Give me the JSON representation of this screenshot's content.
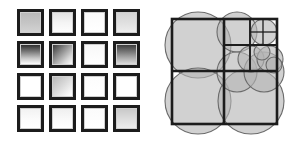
{
  "figure": {
    "background_color": "#ffffff",
    "width": 304,
    "height": 151,
    "panels": [
      "square-grid",
      "recursive-circles"
    ]
  },
  "grid": {
    "name": "gradient-square-grid",
    "rows": 4,
    "columns": 4,
    "cell_size": 27,
    "gap": 5,
    "origin_x": 17,
    "origin_y": 9,
    "border_color": "#1c1c1c",
    "border_width": 3,
    "cells": [
      {
        "row": 1,
        "col": 1,
        "label": "r1c1",
        "fill": "linear-gradient(180deg, #b9b9b9 0%, #c6c6c6 55%, #d2d2d2 100%)"
      },
      {
        "row": 1,
        "col": 2,
        "label": "r1c2",
        "fill": "linear-gradient(180deg, #e3e3e3 0%, #f4f4f4 50%, #fdfdfd 100%)"
      },
      {
        "row": 1,
        "col": 3,
        "label": "r1c3",
        "fill": "linear-gradient(180deg, #fafafa 0%, #ffffff 100%)"
      },
      {
        "row": 1,
        "col": 4,
        "label": "r1c4",
        "fill": "linear-gradient(180deg, #d4d4d4 0%, #e2e2e2 60%, #ededed 100%)"
      },
      {
        "row": 2,
        "col": 1,
        "label": "r2c1",
        "fill": "linear-gradient(180deg, #2e2e2e 0%, #7a7a7a 35%, #c8c8c8 70%, #fcfcfc 100%)"
      },
      {
        "row": 2,
        "col": 2,
        "label": "r2c2",
        "fill": "linear-gradient(135deg, #3a3a3a 0%, #8e8e8e 40%, #d5d5d5 75%, #fbfbfb 100%)"
      },
      {
        "row": 2,
        "col": 3,
        "label": "r2c3",
        "fill": "linear-gradient(180deg, #f7f7f7 0%, #ffffff 100%)"
      },
      {
        "row": 2,
        "col": 4,
        "label": "r2c4",
        "fill": "linear-gradient(180deg, #3c3c3c 0%, #6e6e6e 30%, #a8a8a8 65%, #dcdcdc 100%)"
      },
      {
        "row": 3,
        "col": 1,
        "label": "r3c1",
        "fill": "linear-gradient(180deg, #ffffff 0%, #ffffff 100%)"
      },
      {
        "row": 3,
        "col": 2,
        "label": "r3c2",
        "fill": "linear-gradient(135deg, #b8b8b8 0%, #d8d8d8 45%, #f6f6f6 85%, #ffffff 100%)"
      },
      {
        "row": 3,
        "col": 3,
        "label": "r3c3",
        "fill": "linear-gradient(180deg, #fcfcfc 0%, #ffffff 100%)"
      },
      {
        "row": 3,
        "col": 4,
        "label": "r3c4",
        "fill": "linear-gradient(180deg, #ffffff 0%, #ffffff 100%)"
      },
      {
        "row": 4,
        "col": 1,
        "label": "r4c1",
        "fill": "linear-gradient(180deg, #f2f2f2 0%, #fcfcfc 60%, #ffffff 100%)"
      },
      {
        "row": 4,
        "col": 2,
        "label": "r4c2",
        "fill": "linear-gradient(180deg, #efefef 0%, #fafafa 60%, #ffffff 100%)"
      },
      {
        "row": 4,
        "col": 3,
        "label": "r4c3",
        "fill": "linear-gradient(180deg, #fbfbfb 0%, #ffffff 100%)"
      },
      {
        "row": 4,
        "col": 4,
        "label": "r4c4",
        "fill": "linear-gradient(180deg, #c9c9c9 0%, #dcdcdc 50%, #ececec 100%)"
      }
    ]
  },
  "circles": {
    "name": "recursive-circle-square-packing",
    "disc_fill": "#b4b4b4",
    "disc_opacity": 0.62,
    "disc_stroke": "#6b6b6b",
    "box_stroke": "#1c1c1c",
    "outer_square": {
      "x": 22,
      "y": 19,
      "size": 105
    },
    "discs": [
      {
        "id": "d-outer-tl",
        "cx": 48,
        "cy": 45,
        "r": 33
      },
      {
        "id": "d-outer-bl",
        "cx": 48,
        "cy": 101,
        "r": 33
      },
      {
        "id": "d-outer-br",
        "cx": 101,
        "cy": 101,
        "r": 33
      },
      {
        "id": "d-q2-tl",
        "cx": 87,
        "cy": 32,
        "r": 20
      },
      {
        "id": "d-q2-bl",
        "cx": 87,
        "cy": 72,
        "r": 20
      },
      {
        "id": "d-q2-br",
        "cx": 114,
        "cy": 72,
        "r": 20
      },
      {
        "id": "d-q3-tl",
        "cx": 114,
        "cy": 32,
        "r": 13
      },
      {
        "id": "d-q3-bl",
        "cx": 101,
        "cy": 59,
        "r": 13
      },
      {
        "id": "d-q3-br",
        "cx": 120,
        "cy": 59,
        "r": 13
      },
      {
        "id": "d-q4-tl",
        "cx": 112,
        "cy": 52,
        "r": 8
      },
      {
        "id": "d-q4-br",
        "cx": 124,
        "cy": 65,
        "r": 8
      }
    ],
    "squares": [
      {
        "id": "s-main",
        "x": 22,
        "y": 19,
        "w": 105,
        "h": 105,
        "weight": "box"
      },
      {
        "id": "s-div-h",
        "x": 22,
        "y": 71,
        "w": 105,
        "h": 0,
        "weight": "box"
      },
      {
        "id": "s-div-v",
        "x": 74,
        "y": 19,
        "w": 0,
        "h": 105,
        "weight": "box"
      },
      {
        "id": "s-q2-h",
        "x": 74,
        "y": 45,
        "w": 53,
        "h": 0,
        "weight": "box-thin"
      },
      {
        "id": "s-q2-v",
        "x": 100,
        "y": 19,
        "w": 0,
        "h": 52,
        "weight": "box-thin"
      },
      {
        "id": "s-q3-h",
        "x": 100,
        "y": 32,
        "w": 27,
        "h": 0,
        "weight": "box-hair"
      },
      {
        "id": "s-q3-v",
        "x": 113,
        "y": 19,
        "w": 0,
        "h": 26,
        "weight": "box-hair"
      }
    ]
  }
}
